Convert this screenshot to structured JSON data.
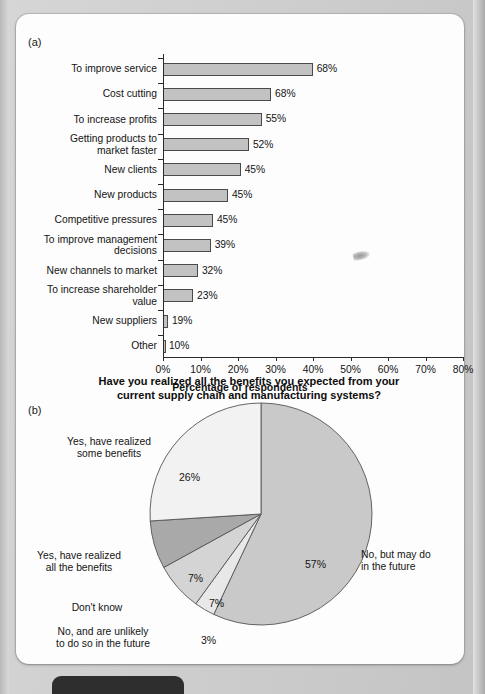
{
  "figure": {
    "panel_a_letter": "(a)",
    "panel_b_letter": "(b)"
  },
  "chart_data": [
    {
      "type": "bar",
      "panel": "(a)",
      "orientation": "horizontal",
      "title": "",
      "xlabel": "Percentage of respondents",
      "ylabel": "",
      "xlim": [
        0,
        80
      ],
      "xticks": [
        "0%",
        "10%",
        "20%",
        "30%",
        "40%",
        "50%",
        "60%",
        "70%",
        "80%"
      ],
      "grid": false,
      "legend": "none",
      "categories": [
        "To improve service",
        "Cost cutting",
        "To increase profits",
        "Getting products to\nmarket faster",
        "New clients",
        "New products",
        "Competitive pressures",
        "To improve management\ndecisions",
        "New channels to market",
        "To increase shareholder\nvalue",
        "New suppliers",
        "Other"
      ],
      "values": [
        68,
        68,
        55,
        52,
        45,
        45,
        45,
        39,
        32,
        23,
        19,
        10
      ],
      "value_labels": [
        "68%",
        "68%",
        "55%",
        "52%",
        "45%",
        "45%",
        "45%",
        "39%",
        "32%",
        "23%",
        "19%",
        "10%"
      ],
      "drawn_lengths_pct": [
        39.9,
        28.8,
        26.3,
        22.9,
        20.7,
        17.3,
        13.3,
        12.7,
        9.3,
        8.0,
        1.3,
        0.5
      ],
      "bar_fill": "#c2c2c2",
      "bar_stroke": "#4a4a4a"
    },
    {
      "type": "pie",
      "panel": "(b)",
      "title": "Have you realized all the benefits you expected from your current supply chain and manufacturing systems?",
      "title_line1": "Have you realized all the benefits you expected from your",
      "title_line2": "current supply chain and manufacturing systems?",
      "labels": [
        "No, but may do\nin the future",
        "No, and are unlikely\nto do so in the future",
        "Don't know",
        "Yes, have realized\nall the benefits",
        "Yes, have realized\nsome benefits"
      ],
      "values": [
        57,
        3,
        7,
        7,
        26
      ],
      "value_labels": [
        "57%",
        "3%",
        "7%",
        "7%",
        "26%"
      ],
      "slice_colors": [
        "#c9c9c9",
        "#e8e8e8",
        "#d4d4d4",
        "#a9a9a9",
        "#f2f2f2"
      ],
      "start_angle_deg": 0,
      "direction": "clockwise",
      "legend": "callout-labels"
    }
  ],
  "bar_chart_ui": {
    "xaxis_title": "Percentage of respondents"
  },
  "pie_chart_ui": {
    "label_no_but_may": "No, but may do\nin the future",
    "label_no_unlikely": "No, and are unlikely\nto do so in the future",
    "label_dont_know": "Don't know",
    "label_yes_all": "Yes, have realized\nall the benefits",
    "label_yes_some": "Yes, have realized\nsome benefits",
    "pct_57": "57%",
    "pct_3": "3%",
    "pct_7_a": "7%",
    "pct_7_b": "7%",
    "pct_26": "26%"
  }
}
